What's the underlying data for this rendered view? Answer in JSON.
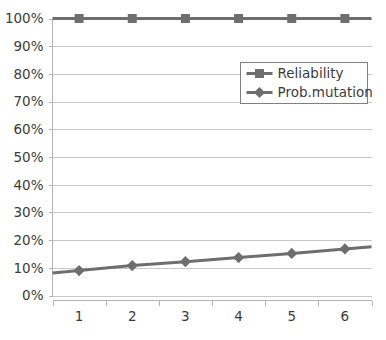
{
  "chart_data": {
    "type": "line",
    "title": "",
    "xlabel": "",
    "ylabel": "",
    "categories": [
      "1",
      "2",
      "3",
      "4",
      "5",
      "6"
    ],
    "ylim": [
      0,
      100
    ],
    "ytick_labels": [
      "0%",
      "10%",
      "20%",
      "30%",
      "40%",
      "50%",
      "60%",
      "70%",
      "80%",
      "90%",
      "100%"
    ],
    "ytick_values": [
      0,
      10,
      20,
      30,
      40,
      50,
      60,
      70,
      80,
      90,
      100
    ],
    "grid": "horizontal",
    "legend_position": "inside-upper-right",
    "series": [
      {
        "name": "Reliability",
        "marker": "square",
        "color": "#6e6e6e",
        "values": [
          100,
          100,
          100,
          100,
          100,
          100
        ]
      },
      {
        "name": "Prob.mutation",
        "marker": "diamond",
        "color": "#6e6e6e",
        "values": [
          9,
          10.8,
          12.2,
          13.7,
          15.2,
          16.8
        ]
      }
    ]
  },
  "colors": {
    "series": "#6e6e6e",
    "gridline": "#c8c8c8",
    "axis": "#b4b4b4",
    "text": "#3b3b3b",
    "legend_border": "#808080",
    "background": "#ffffff"
  }
}
